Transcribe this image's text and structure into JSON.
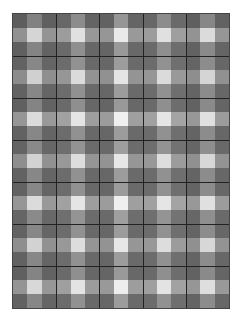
{
  "image": {
    "description": "Gray gingham/plaid checkered pattern on white background",
    "columns": 15,
    "rows": 21,
    "column_tones": [
      0.25,
      0.6,
      0.28,
      0.35,
      0.7,
      0.32,
      0.3,
      0.8,
      0.33,
      0.35,
      0.7,
      0.38,
      0.27,
      0.65,
      0.3
    ],
    "row_tones": [
      0.25,
      0.75,
      0.28,
      0.3,
      0.7,
      0.3,
      0.28,
      0.8,
      0.3,
      0.32,
      0.72,
      0.3,
      0.3,
      0.8,
      0.33,
      0.3,
      0.72,
      0.3,
      0.28,
      0.78,
      0.3
    ],
    "separator_every": 3,
    "colors": {
      "background": "#ffffff",
      "separator": "#222222"
    }
  }
}
